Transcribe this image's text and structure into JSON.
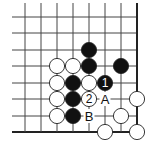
{
  "diagram": {
    "type": "go-board-corner",
    "corner": "bottom-right",
    "columns": 8,
    "rows": 8,
    "grid": {
      "x": [
        25,
        41,
        57,
        73,
        89,
        105,
        121,
        137
      ],
      "y": [
        17,
        33,
        50,
        66,
        83,
        99,
        116,
        132
      ],
      "line_left": 12,
      "line_top": 3,
      "line_color": "#444444",
      "edge_color": "#222222"
    },
    "stones": [
      {
        "color": "black",
        "col": 4,
        "row": 2,
        "label": ""
      },
      {
        "color": "white",
        "col": 2,
        "row": 3,
        "label": ""
      },
      {
        "color": "white",
        "col": 3,
        "row": 3,
        "label": ""
      },
      {
        "color": "black",
        "col": 4,
        "row": 3,
        "label": ""
      },
      {
        "color": "black",
        "col": 6,
        "row": 3,
        "label": ""
      },
      {
        "color": "white",
        "col": 2,
        "row": 4,
        "label": ""
      },
      {
        "color": "black",
        "col": 3,
        "row": 4,
        "label": ""
      },
      {
        "color": "white",
        "col": 4,
        "row": 4,
        "label": ""
      },
      {
        "color": "black",
        "col": 5,
        "row": 4,
        "label": "1"
      },
      {
        "color": "white",
        "col": 2,
        "row": 5,
        "label": ""
      },
      {
        "color": "black",
        "col": 3,
        "row": 5,
        "label": ""
      },
      {
        "color": "white",
        "col": 4,
        "row": 5,
        "label": "2"
      },
      {
        "color": "white",
        "col": 7,
        "row": 5,
        "label": ""
      },
      {
        "color": "white",
        "col": 2,
        "row": 6,
        "label": ""
      },
      {
        "color": "black",
        "col": 3,
        "row": 6,
        "label": ""
      },
      {
        "color": "white",
        "col": 6,
        "row": 6,
        "label": ""
      },
      {
        "color": "white",
        "col": 5,
        "row": 7,
        "label": ""
      },
      {
        "color": "white",
        "col": 7,
        "row": 7,
        "label": ""
      }
    ],
    "markers": [
      {
        "label": "A",
        "col": 5,
        "row": 5
      },
      {
        "label": "B",
        "col": 4,
        "row": 6
      }
    ]
  }
}
